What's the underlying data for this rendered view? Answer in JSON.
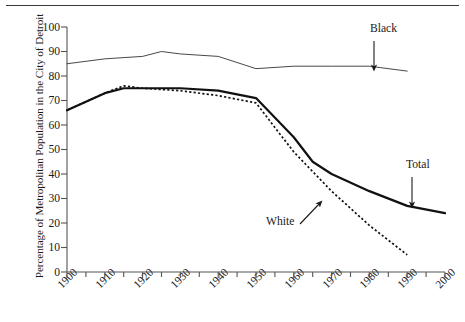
{
  "chart_data": {
    "type": "line",
    "title": "",
    "xlabel": "",
    "ylabel": "Percentage of Metropolitan Population in the City of Detroit",
    "xlim": [
      1900,
      2000
    ],
    "ylim": [
      0,
      100
    ],
    "x_ticks": [
      "1900",
      "1910",
      "1920",
      "1930",
      "1940",
      "1950",
      "1960",
      "1970",
      "1980",
      "1990",
      "2000"
    ],
    "y_ticks": [
      "0",
      "10",
      "20",
      "30",
      "40",
      "50",
      "60",
      "70",
      "80",
      "90",
      "100"
    ],
    "grid": false,
    "legend_position": "inline-annotations",
    "minor_tick_interval": 5,
    "series": [
      {
        "name": "Black",
        "style": "thin-solid",
        "color": "#333333",
        "x": [
          1900,
          1910,
          1920,
          1925,
          1930,
          1940,
          1950,
          1960,
          1970,
          1980,
          1990
        ],
        "values": [
          85,
          87,
          88,
          90,
          89,
          88,
          83,
          84,
          84,
          84,
          82
        ]
      },
      {
        "name": "Total",
        "style": "thick-solid",
        "color": "#111111",
        "x": [
          1900,
          1910,
          1915,
          1920,
          1930,
          1940,
          1950,
          1960,
          1965,
          1970,
          1980,
          1990,
          2000
        ],
        "values": [
          66,
          73,
          75,
          75,
          75,
          74,
          71,
          55,
          45,
          40,
          33,
          27,
          24
        ]
      },
      {
        "name": "White",
        "style": "dotted",
        "color": "#111111",
        "x": [
          1900,
          1910,
          1915,
          1920,
          1930,
          1940,
          1950,
          1960,
          1970,
          1980,
          1990
        ],
        "values": [
          66,
          73,
          76,
          75,
          74,
          72,
          69,
          49,
          33,
          19,
          7
        ]
      }
    ],
    "annotations": [
      {
        "text": "Black",
        "label_x": 370,
        "label_y": 30,
        "arrow_from_x": 374,
        "arrow_from_y": 41,
        "arrow_to_x": 374,
        "arrow_to_y": 68
      },
      {
        "text": "Total",
        "label_x": 406,
        "label_y": 166,
        "arrow_from_x": 412,
        "arrow_from_y": 177,
        "arrow_to_x": 412,
        "arrow_to_y": 205
      },
      {
        "text": "White",
        "label_x": 268,
        "label_y": 222,
        "arrow_from_x": 300,
        "arrow_from_y": 224,
        "arrow_to_x": 320,
        "arrow_to_y": 203
      }
    ]
  }
}
